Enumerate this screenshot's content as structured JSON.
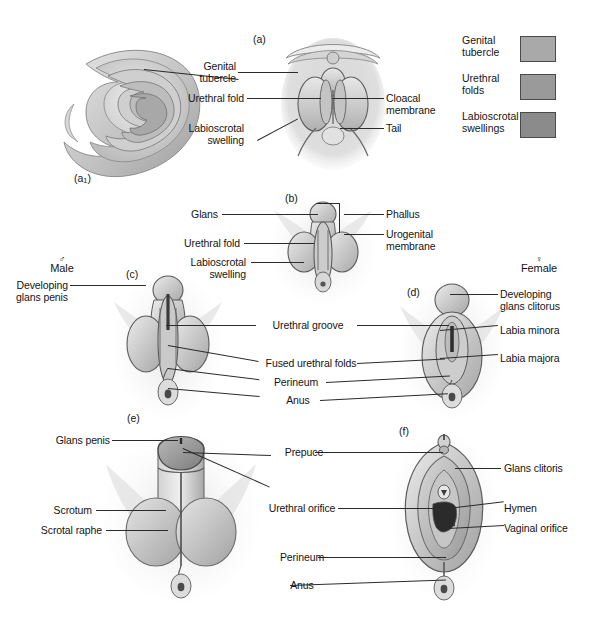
{
  "figure": {
    "background_color": "#ffffff",
    "line_color": "#2b2b2b"
  },
  "legend": {
    "items": [
      {
        "label": "Genital\ntubercle",
        "color": "#a9a9a9"
      },
      {
        "label": "Urethral\nfolds",
        "color": "#9a9a9a"
      },
      {
        "label": "Labioscrotal\nswellings",
        "color": "#8b8b8b"
      }
    ]
  },
  "sex_headers": {
    "male": {
      "symbol": "♂",
      "word": "Male"
    },
    "female": {
      "symbol": "♀",
      "word": "Female"
    }
  },
  "panels": [
    {
      "id": "a1",
      "letter": "(a",
      "letter_sub": "1",
      "letter_close": ")"
    },
    {
      "id": "a",
      "letter": "(a)"
    },
    {
      "id": "b",
      "letter": "(b)"
    },
    {
      "id": "c",
      "letter": "(c)"
    },
    {
      "id": "d",
      "letter": "(d)"
    },
    {
      "id": "e",
      "letter": "(e)"
    },
    {
      "id": "f",
      "letter": "(f)"
    }
  ],
  "labels": {
    "row_a": {
      "genital_tubercle": "Genital\ntubercle",
      "urethral_fold": "Urethral fold",
      "labioscrotal_swelling": "Labioscrotal\nswelling",
      "cloacal_membrane": "Cloacal\nmembrane",
      "tail": "Tail"
    },
    "row_b": {
      "glans": "Glans",
      "urethral_fold": "Urethral fold",
      "labioscrotal_swelling": "Labioscrotal\nswelling",
      "phallus": "Phallus",
      "urogenital_membrane": "Urogenital\nmembrane"
    },
    "row_cd": {
      "developing_glans_penis": "Developing\nglans penis",
      "developing_glans_clitorus": "Developing\nglans clitorus",
      "urethral_groove": "Urethral groove",
      "fused_urethral_folds": "Fused urethral folds",
      "perineum": "Perineum",
      "anus": "Anus",
      "labia_minora": "Labia minora",
      "labia_majora": "Labia majora"
    },
    "row_ef": {
      "glans_penis": "Glans penis",
      "scrotum": "Scrotum",
      "scrotal_raphe": "Scrotal raphe",
      "prepuce": "Prepuce",
      "urethral_orifice": "Urethral orifice",
      "perineum": "Perineum",
      "anus": "Anus",
      "glans_clitoris": "Glans clitoris",
      "hymen": "Hymen",
      "vaginal_orifice": "Vaginal orifice"
    }
  }
}
